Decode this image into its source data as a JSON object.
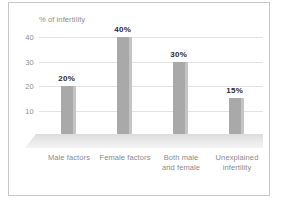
{
  "chart_data": {
    "type": "bar",
    "title": "",
    "subtitle": "",
    "ylabel": "% of infertility",
    "xlabel": "",
    "categories": [
      "Male factors",
      "Female factors",
      "Both male and female",
      "Unexplained infertility"
    ],
    "category_lines": [
      [
        "Male factors"
      ],
      [
        "Female factors"
      ],
      [
        "Both male",
        "and female"
      ],
      [
        "Unexplained",
        "infertility"
      ]
    ],
    "values": [
      20,
      40,
      30,
      15
    ],
    "data_labels": [
      "20%",
      "40%",
      "30%",
      "15%"
    ],
    "yticks": [
      40,
      30,
      20,
      10
    ],
    "ytick_labels": [
      "40",
      "30",
      "20",
      "10"
    ],
    "ylim": [
      0,
      45
    ],
    "grid": true,
    "legend": false,
    "legend_position": "none",
    "colors": {
      "bar": "#a9a9a9",
      "bar_edge": "#c4c4c4",
      "gridline": "#e3e3e3",
      "tick_text": "#8d8d8d",
      "label_text": "#2b2b2b",
      "category_text": "#8a8a8a",
      "frame_border": "#c9c9c9",
      "floor": "#e8e8e8",
      "background": "#ffffff"
    }
  }
}
